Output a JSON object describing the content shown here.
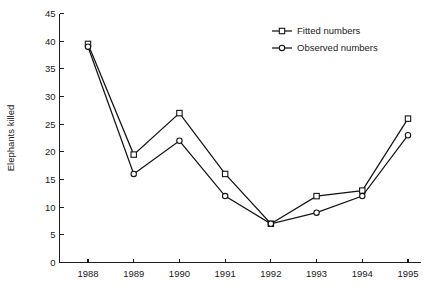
{
  "chart_data": {
    "type": "line",
    "title": "",
    "xlabel": "",
    "ylabel": "Elephants killed",
    "categories": [
      "1988",
      "1989",
      "1990",
      "1991",
      "1992",
      "1993",
      "1994",
      "1995"
    ],
    "x": [
      1988,
      1989,
      1990,
      1991,
      1992,
      1993,
      1994,
      1995
    ],
    "series": [
      {
        "name": "Fitted numbers",
        "marker": "open-square",
        "color": "#141414",
        "values": [
          39.5,
          19.5,
          27,
          16,
          7,
          12,
          13,
          26
        ]
      },
      {
        "name": "Observed numbers",
        "marker": "open-circle",
        "color": "#141414",
        "values": [
          39,
          16,
          22,
          12,
          7,
          9,
          12,
          23
        ]
      }
    ],
    "ylim": [
      0,
      45
    ],
    "yticks": [
      0,
      5,
      10,
      15,
      20,
      25,
      30,
      35,
      40,
      45
    ],
    "ytick_labels": [
      "0",
      "5",
      "10",
      "15",
      "20",
      "25",
      "30",
      "35",
      "40",
      "45"
    ],
    "xtick_labels": [
      "1988",
      "1989",
      "1990",
      "1991",
      "1992",
      "1993",
      "1994",
      "1995"
    ],
    "grid": false,
    "legend_position": "top-right",
    "legend_entries": [
      "Fitted numbers",
      "Observed numbers"
    ]
  },
  "axes": {
    "y_title": "Elephants killed"
  },
  "legend": {
    "items": [
      {
        "label": "Fitted numbers"
      },
      {
        "label": "Observed numbers"
      }
    ]
  }
}
